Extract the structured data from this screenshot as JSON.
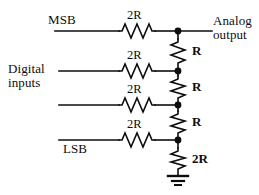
{
  "diagram": {
    "type": "schematic",
    "background_color": "#ffffff",
    "line_color": "#0d0d0d",
    "ports": {
      "msb_label": "MSB",
      "lsb_label": "LSB",
      "inputs_group_line1": "Digital",
      "inputs_group_line2": "inputs",
      "output_line1": "Analog",
      "output_line2": "output"
    },
    "series_resistors": [
      {
        "label": "2R",
        "branch": "msb"
      },
      {
        "label": "2R",
        "branch": "bit2"
      },
      {
        "label": "2R",
        "branch": "bit3"
      },
      {
        "label": "2R",
        "branch": "lsb"
      }
    ],
    "ladder_resistors": [
      {
        "label": "R",
        "position": "node1-node2"
      },
      {
        "label": "R",
        "position": "node2-node3"
      },
      {
        "label": "R",
        "position": "node3-node4"
      },
      {
        "label": "2R",
        "position": "node4-ground"
      }
    ],
    "nodes": [
      {
        "name": "node-1"
      },
      {
        "name": "node-2"
      },
      {
        "name": "node-3"
      },
      {
        "name": "node-4"
      }
    ],
    "ground": {
      "label": ""
    }
  }
}
